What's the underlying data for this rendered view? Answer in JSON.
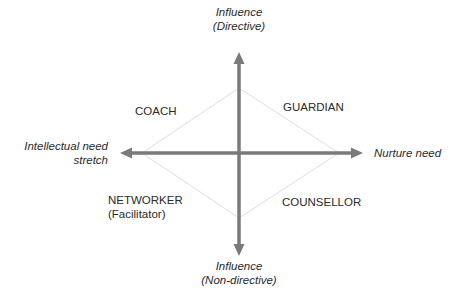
{
  "diagram": {
    "type": "quadrant-diamond",
    "axes": {
      "top": {
        "line1": "Influence",
        "line2": "(Directive)"
      },
      "bottom": {
        "line1": "Influence",
        "line2": "(Non-directive)"
      },
      "left": {
        "line1": "Intellectual need",
        "line2": "stretch"
      },
      "right": {
        "line1": "Nurture need"
      }
    },
    "quadrants": {
      "top_left": {
        "label": "COACH"
      },
      "top_right": {
        "label": "GUARDIAN"
      },
      "bottom_left": {
        "label": "NETWORKER",
        "sublabel": "(Facilitator)"
      },
      "bottom_right": {
        "label": "COUNSELLOR"
      }
    },
    "colors": {
      "axis": "#7a7a7a",
      "diamond": "#dcdcdc",
      "text": "#2a2a2a"
    }
  }
}
